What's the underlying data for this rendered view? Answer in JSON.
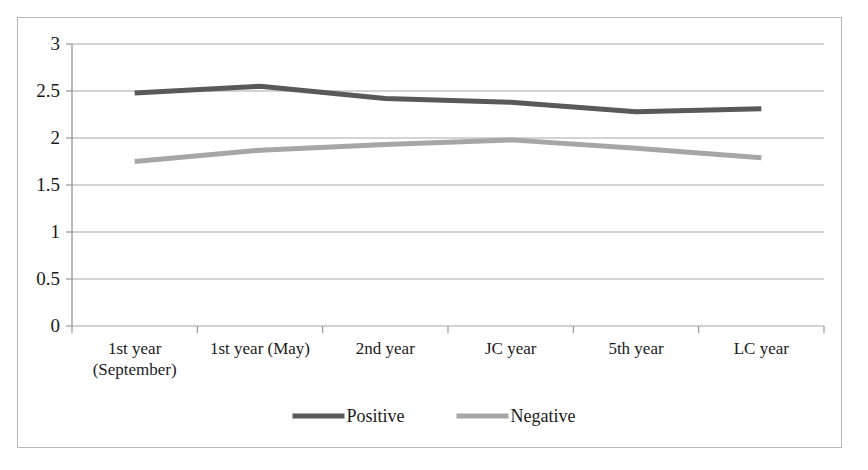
{
  "chart_data": {
    "type": "line",
    "title": "",
    "subtitle": "",
    "xlabel": "",
    "ylabel": "",
    "ylim": [
      0,
      3
    ],
    "ytick_labels": [
      "0",
      "0.5",
      "1",
      "1.5",
      "2",
      "2.5",
      "3"
    ],
    "ytick_values": [
      0,
      0.5,
      1,
      1.5,
      2,
      2.5,
      3
    ],
    "grid": "horizontal",
    "legend_position": "bottom-center",
    "categories": [
      "1st year (September)",
      "1st year (May)",
      "2nd year",
      "JC year",
      "5th year",
      "LC year"
    ],
    "category_label_lines": [
      [
        "1st year",
        "(September)"
      ],
      [
        "1st year (May)"
      ],
      [
        "2nd year"
      ],
      [
        "JC year"
      ],
      [
        "5th year"
      ],
      [
        "LC year"
      ]
    ],
    "series": [
      {
        "name": "Positive",
        "color": "#595959",
        "values": [
          2.48,
          2.55,
          2.42,
          2.38,
          2.28,
          2.31
        ]
      },
      {
        "name": "Negative",
        "color": "#a6a6a6",
        "values": [
          1.75,
          1.87,
          1.93,
          1.98,
          1.89,
          1.79
        ]
      }
    ]
  },
  "legend": {
    "items": [
      {
        "label": "Positive",
        "color": "#595959"
      },
      {
        "label": "Negative",
        "color": "#a6a6a6"
      }
    ]
  },
  "axes": {
    "gridline_color": "#a8a8a8",
    "axis_color": "#8c8c8c",
    "border_color": "#b9b9b9"
  }
}
